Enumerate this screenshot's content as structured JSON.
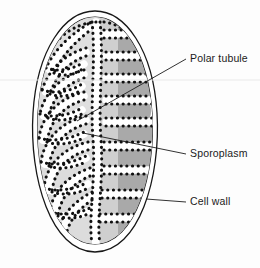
{
  "figure": {
    "kind": "biological-diagram",
    "background_color": "#fdfdfd"
  },
  "labels": [
    {
      "id": "polar-tubule",
      "text": "Polar tubule",
      "x": 190,
      "y": 62,
      "leader": {
        "x1": 186,
        "y1": 59,
        "x2": 77,
        "y2": 121
      }
    },
    {
      "id": "sporoplasm",
      "text": "Sporoplasm",
      "x": 190,
      "y": 157,
      "leader": {
        "x1": 186,
        "y1": 154,
        "x2": 83,
        "y2": 133
      }
    },
    {
      "id": "cell-wall",
      "text": "Cell wall",
      "x": 190,
      "y": 205,
      "leader": {
        "x1": 186,
        "y1": 202,
        "x2": 146,
        "y2": 199
      }
    }
  ],
  "structures": {
    "cell_wall": {
      "name": "cell wall",
      "stroke": "#171717",
      "outer_stroke_width": 1.3,
      "inner_stroke_width": 1.1,
      "gap_fill": "#ffffff"
    },
    "sporoplasm": {
      "name": "sporoplasm",
      "light_fill": "#dcdcdc",
      "mid_fill": "#c9c9c9",
      "dark_fill": "#a9a9a9"
    },
    "polar_tubule": {
      "name": "polar tubule",
      "dot_color": "#111111",
      "dot_radius": 1.55,
      "description": "coiled tubule shown as dotted outlines"
    }
  },
  "artifacts": {
    "scan_line_color": "#e9e9e9",
    "scan_line_y": 80
  }
}
